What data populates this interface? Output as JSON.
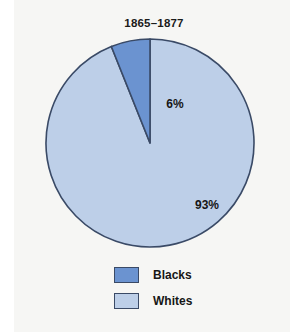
{
  "figure": {
    "background_color": "#f6f6f4",
    "page_color": "#ffffff"
  },
  "chart_data": {
    "type": "pie",
    "title": "1865–1877",
    "subtitle": "",
    "xlabel": "",
    "ylabel": "",
    "categories": [
      "Blacks",
      "Whites"
    ],
    "values": [
      6,
      93
    ],
    "value_labels": [
      "6%",
      "93%"
    ],
    "colors": [
      "#6b93d0",
      "#bdcfe8"
    ],
    "stroke_color": "#3a4a66",
    "start_angle_deg": 90,
    "direction": "counterclockwise",
    "legend": {
      "position": "bottom",
      "entries": [
        {
          "label": "Blacks",
          "color": "#6b93d0"
        },
        {
          "label": "Whites",
          "color": "#bdcfe8"
        }
      ]
    },
    "grid": false
  }
}
